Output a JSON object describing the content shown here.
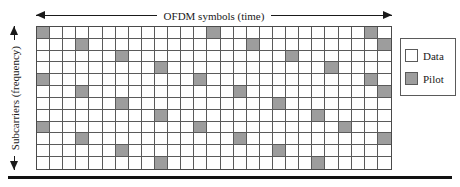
{
  "figure": {
    "x_axis": {
      "label": "OFDM symbols (time)",
      "arrow_left": "left-arrow-icon",
      "arrow_right": "right-arrow-icon"
    },
    "y_axis": {
      "label": "Subcarriers (frequency)",
      "arrow_up": "up-arrow-icon",
      "arrow_down": "down-arrow-icon"
    }
  },
  "legend": {
    "items": [
      {
        "label": "Data",
        "color": "#ffffff",
        "swatch": "data-swatch"
      },
      {
        "label": "Pilot",
        "color": "#9d9d9d",
        "swatch": "pilot-swatch"
      }
    ]
  },
  "colors": {
    "data_cell": "#ffffff",
    "pilot_cell": "#9d9d9d",
    "grid_line": "#5a5a5a",
    "grid_border": "#4a4a4a",
    "rule": "#111111",
    "text": "#1a1a1a"
  },
  "chart_data": {
    "type": "heatmap",
    "xlabel": "OFDM symbols (time)",
    "ylabel": "Subcarriers (frequency)",
    "grid": true,
    "legend_position": "right",
    "columns": 27,
    "rows": 12,
    "cell_values": {
      "0": "Data",
      "1": "Pilot"
    },
    "pilot_spacing": {
      "time": 4,
      "frequency": 4,
      "diagonal_shift": 1
    },
    "pilot_cells": [
      [
        0,
        0
      ],
      [
        0,
        13
      ],
      [
        0,
        26
      ],
      [
        1,
        3
      ],
      [
        1,
        16
      ],
      [
        1,
        29
      ],
      [
        2,
        6
      ],
      [
        2,
        19
      ],
      [
        3,
        9
      ],
      [
        3,
        22
      ],
      [
        4,
        0
      ],
      [
        4,
        12
      ],
      [
        4,
        25
      ],
      [
        5,
        3
      ],
      [
        5,
        15
      ],
      [
        5,
        28
      ],
      [
        6,
        6
      ],
      [
        6,
        18
      ],
      [
        7,
        9
      ],
      [
        7,
        21
      ],
      [
        8,
        0
      ],
      [
        8,
        12
      ],
      [
        8,
        24
      ],
      [
        9,
        3
      ],
      [
        9,
        15
      ],
      [
        9,
        27
      ],
      [
        10,
        6
      ],
      [
        10,
        18
      ],
      [
        11,
        9
      ],
      [
        11,
        21
      ]
    ],
    "matrix": [
      [
        1,
        0,
        0,
        0,
        0,
        0,
        0,
        0,
        0,
        0,
        0,
        0,
        0,
        1,
        0,
        0,
        0,
        0,
        0,
        0,
        0,
        0,
        0,
        0,
        0,
        1,
        0
      ],
      [
        0,
        0,
        0,
        1,
        0,
        0,
        0,
        0,
        0,
        0,
        0,
        0,
        0,
        0,
        0,
        0,
        1,
        0,
        0,
        0,
        0,
        0,
        0,
        0,
        0,
        0,
        1
      ],
      [
        0,
        0,
        0,
        0,
        0,
        0,
        1,
        0,
        0,
        0,
        0,
        0,
        0,
        0,
        0,
        0,
        0,
        0,
        0,
        1,
        0,
        0,
        0,
        0,
        0,
        0,
        0
      ],
      [
        0,
        0,
        0,
        0,
        0,
        0,
        0,
        0,
        0,
        1,
        0,
        0,
        0,
        0,
        0,
        0,
        0,
        0,
        0,
        0,
        0,
        0,
        1,
        0,
        0,
        0,
        0
      ],
      [
        1,
        0,
        0,
        0,
        0,
        0,
        0,
        0,
        0,
        0,
        0,
        0,
        1,
        0,
        0,
        0,
        0,
        0,
        0,
        0,
        0,
        0,
        0,
        0,
        0,
        1,
        0
      ],
      [
        0,
        0,
        0,
        1,
        0,
        0,
        0,
        0,
        0,
        0,
        0,
        0,
        0,
        0,
        0,
        1,
        0,
        0,
        0,
        0,
        0,
        0,
        0,
        0,
        0,
        0,
        1
      ],
      [
        0,
        0,
        0,
        0,
        0,
        0,
        1,
        0,
        0,
        0,
        0,
        0,
        0,
        0,
        0,
        0,
        0,
        0,
        1,
        0,
        0,
        0,
        0,
        0,
        0,
        0,
        0
      ],
      [
        0,
        0,
        0,
        0,
        0,
        0,
        0,
        0,
        0,
        1,
        0,
        0,
        0,
        0,
        0,
        0,
        0,
        0,
        0,
        0,
        0,
        1,
        0,
        0,
        0,
        0,
        0
      ],
      [
        1,
        0,
        0,
        0,
        0,
        0,
        0,
        0,
        0,
        0,
        0,
        0,
        1,
        0,
        0,
        0,
        0,
        0,
        0,
        0,
        0,
        0,
        0,
        1,
        0,
        0,
        0
      ],
      [
        0,
        0,
        0,
        1,
        0,
        0,
        0,
        0,
        0,
        0,
        0,
        0,
        0,
        0,
        0,
        1,
        0,
        0,
        0,
        0,
        0,
        0,
        0,
        0,
        0,
        0,
        1
      ],
      [
        0,
        0,
        0,
        0,
        0,
        0,
        1,
        0,
        0,
        0,
        0,
        0,
        0,
        0,
        0,
        0,
        0,
        0,
        1,
        0,
        0,
        0,
        0,
        0,
        0,
        0,
        0
      ],
      [
        0,
        0,
        0,
        0,
        0,
        0,
        0,
        0,
        0,
        1,
        0,
        0,
        0,
        0,
        0,
        0,
        0,
        0,
        0,
        0,
        0,
        1,
        0,
        0,
        0,
        0,
        0
      ]
    ]
  }
}
